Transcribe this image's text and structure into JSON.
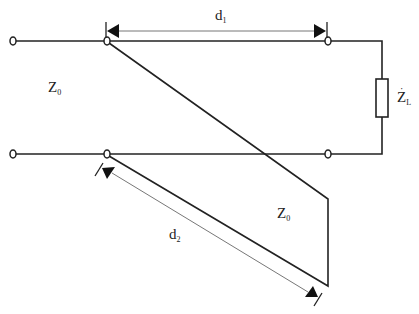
{
  "diagram": {
    "type": "transmission-line single-stub matching circuit",
    "labels": {
      "z0_main": {
        "main": "Z",
        "sub": "0"
      },
      "z0_stub": {
        "main": "Z",
        "sub": "0"
      },
      "load": {
        "main": "Z",
        "sub": "L",
        "accent": "·"
      },
      "d1": {
        "main": "d",
        "sub": "1"
      },
      "d2": {
        "main": "d",
        "sub": "2"
      }
    },
    "colors": {
      "line": "#222222",
      "dim_line": "#777777",
      "background": "#ffffff"
    }
  }
}
